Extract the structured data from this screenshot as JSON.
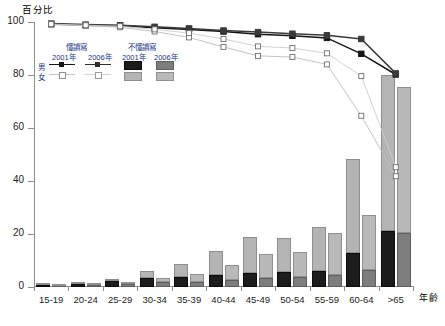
{
  "chart_data": {
    "type": "bar",
    "title": "",
    "ylabel": "百分比",
    "xlabel": "年齡",
    "categories": [
      "15-19",
      "20-24",
      "25-29",
      "30-34",
      "35-39",
      "40-44",
      "45-49",
      "50-54",
      "55-59",
      "60-64",
      ">65"
    ],
    "ylim": [
      0,
      100
    ],
    "yticks": [
      0,
      20,
      40,
      60,
      80,
      100
    ],
    "grid": false,
    "legend_position": "upper-left-inside",
    "bar_series": [
      {
        "name": "不懂讀寫 2001年 男",
        "key": "illiterate_2001_male",
        "color": "#1c1c1c",
        "values": [
          0.6,
          1.2,
          2.2,
          3.4,
          3.6,
          4.4,
          5.4,
          5.6,
          6.2,
          12.8,
          21.0
        ]
      },
      {
        "name": "不懂讀寫 2001年 女",
        "key": "illiterate_2001_female",
        "color": "#b4b4b4",
        "values": [
          0.3,
          0.5,
          1.0,
          2.6,
          5.2,
          9.2,
          13.4,
          13.0,
          16.4,
          35.6,
          59.0
        ]
      },
      {
        "name": "不懂讀寫 2006年 男",
        "key": "illiterate_2006_male",
        "color": "#7d7d7d",
        "values": [
          0.4,
          0.8,
          1.2,
          1.8,
          2.0,
          2.6,
          3.4,
          3.8,
          4.4,
          6.4,
          20.4
        ]
      },
      {
        "name": "不懂讀寫 2006年 女",
        "key": "illiterate_2006_female",
        "color": "#b9b9b9",
        "values": [
          0.2,
          0.4,
          0.8,
          1.6,
          2.8,
          5.8,
          9.2,
          9.6,
          16.0,
          20.8,
          55.0
        ]
      }
    ],
    "line_series": [
      {
        "name": "懂讀寫 2001年 男",
        "key": "literate_2001_male",
        "color": "#151515",
        "marker": "filled-square",
        "values": [
          99.2,
          98.8,
          98.6,
          97.8,
          97.2,
          96.4,
          95.4,
          94.8,
          94.0,
          88.0,
          80.2
        ]
      },
      {
        "name": "懂讀寫 2006年 男",
        "key": "literate_2006_male",
        "color": "#3a3a3a",
        "marker": "filled-square",
        "values": [
          99.4,
          99.0,
          98.8,
          98.2,
          97.6,
          96.8,
          96.2,
          95.6,
          95.0,
          93.6,
          80.6
        ]
      },
      {
        "name": "懂讀寫 2001年 女",
        "key": "literate_2001_female",
        "color": "#bdbdbd",
        "marker": "open-square",
        "values": [
          99.0,
          98.6,
          98.0,
          96.4,
          94.2,
          90.6,
          87.2,
          86.8,
          84.0,
          64.6,
          41.8
        ]
      },
      {
        "name": "懂讀寫 2006年 女",
        "key": "literate_2006_female",
        "color": "#cdcdcd",
        "marker": "open-square",
        "values": [
          99.2,
          98.8,
          98.4,
          97.2,
          95.8,
          93.6,
          90.8,
          90.2,
          88.2,
          79.6,
          45.2
        ]
      }
    ]
  },
  "legend": {
    "group_left": "懂讀寫",
    "group_right": "不懂讀寫",
    "col_1": "2001年",
    "col_2": "2006年",
    "col_3": "2001年",
    "col_4": "2006年",
    "row_male": "男",
    "row_female": "女"
  },
  "colors": {
    "male_2001": "#1c1c1c",
    "female_2001": "#b4b4b4",
    "male_2006": "#7d7d7d",
    "female_2006": "#b9b9b9",
    "axis": "#8c8c8c",
    "legend_text": "#16348f"
  }
}
